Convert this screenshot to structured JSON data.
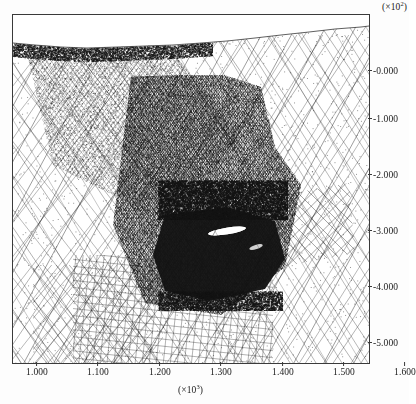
{
  "figure": {
    "background_color": "#fdfdfd",
    "frame_color": "#3a3a3a",
    "ink_color": "#141414"
  },
  "chart_data": {
    "type": "scatter",
    "title": "",
    "subtitle": "",
    "xlabel": "(×10³)",
    "ylabel": "(×10²)",
    "x_exponent_label": "(×10",
    "x_exponent_power": "3",
    "y_exponent_label": "(×10",
    "y_exponent_power": "2",
    "grid": false,
    "legend": "none",
    "xlim": [
      955,
      1625
    ],
    "ylim": [
      -560,
      72
    ],
    "x_tick_values": [
      1.0,
      1.1,
      1.2,
      1.3,
      1.4,
      1.5,
      1.6
    ],
    "x_tick_labels": [
      "1.000",
      "1.100",
      "1.200",
      "1.300",
      "1.400",
      "1.500",
      "1.600"
    ],
    "y_tick_values": [
      -0.0,
      -1.0,
      -2.0,
      -3.0,
      -4.0,
      -5.0
    ],
    "y_tick_labels": [
      "-0.000",
      "-1.000",
      "-2.000",
      "-3.000",
      "-4.000",
      "-5.000"
    ],
    "x_tick_positions_px": [
      37,
      98,
      160,
      221,
      283,
      344,
      405
    ],
    "y_tick_positions_px": [
      70,
      118,
      174,
      230,
      286,
      342
    ],
    "series": [
      {
        "name": "free-surface-boundary",
        "style": "polyline",
        "points_px": [
          [
            0,
            28
          ],
          [
            22,
            30
          ],
          [
            48,
            32
          ],
          [
            74,
            33
          ],
          [
            104,
            32
          ],
          [
            132,
            31
          ],
          [
            160,
            30
          ],
          [
            188,
            28
          ],
          [
            214,
            26
          ],
          [
            242,
            23
          ],
          [
            268,
            20
          ],
          [
            296,
            17
          ],
          [
            322,
            14
          ],
          [
            348,
            12
          ],
          [
            356,
            11
          ]
        ]
      },
      {
        "name": "terrain-fill-boundary",
        "style": "polyline",
        "points_px": [
          [
            0,
            32
          ],
          [
            20,
            31
          ],
          [
            44,
            30
          ],
          [
            70,
            30
          ],
          [
            96,
            29
          ],
          [
            124,
            29
          ],
          [
            150,
            28
          ],
          [
            176,
            24
          ],
          [
            200,
            22
          ],
          [
            228,
            20
          ],
          [
            252,
            18
          ],
          [
            278,
            16
          ],
          [
            304,
            14
          ],
          [
            330,
            13
          ],
          [
            356,
            12
          ]
        ]
      }
    ],
    "mesh_regions": [
      {
        "name": "coarse-diagonal-crosshatch-left",
        "pattern": "diagonal-crosshatch",
        "angle_deg": 52,
        "spacing_px": 21,
        "density": "coarse",
        "bounds_px": [
          0,
          30,
          150,
          348
        ]
      },
      {
        "name": "coarse-diagonal-crosshatch-right",
        "pattern": "diagonal-crosshatch",
        "angle_deg": 58,
        "spacing_px": 22,
        "density": "coarse",
        "bounds_px": [
          200,
          20,
          356,
          348
        ]
      },
      {
        "name": "fine-rectangular-grid-lower",
        "pattern": "rectangular-grid",
        "angle_deg": 6,
        "spacing_px": 7,
        "density": "fine",
        "bounds_px": [
          60,
          240,
          260,
          348
        ]
      },
      {
        "name": "medium-crosshatch-lower-left",
        "pattern": "diagonal-crosshatch",
        "angle_deg": 50,
        "spacing_px": 10,
        "density": "medium",
        "bounds_px": [
          20,
          250,
          140,
          348
        ]
      },
      {
        "name": "medium-diagonal-grid-right-mid",
        "pattern": "diagonal-grid",
        "angle_deg": 45,
        "spacing_px": 9,
        "density": "medium",
        "bounds_px": [
          255,
          165,
          340,
          250
        ]
      },
      {
        "name": "dense-refined-core",
        "pattern": "dense-scatter",
        "density": "very-high",
        "bounds_px": [
          100,
          60,
          290,
          300
        ]
      },
      {
        "name": "saturated-black-cluster",
        "pattern": "solid-saturated",
        "density": "saturated",
        "bounds_px": [
          150,
          195,
          280,
          285
        ]
      },
      {
        "name": "white-streak-highlight",
        "pattern": "void",
        "bounds_px": [
          198,
          212,
          232,
          220
        ]
      }
    ]
  }
}
